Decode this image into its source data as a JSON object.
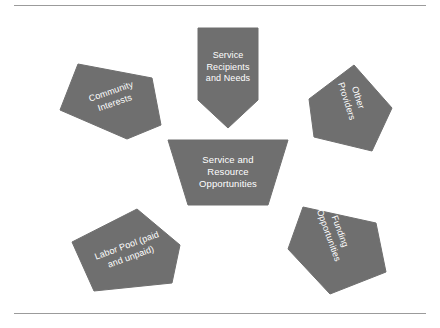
{
  "diagram": {
    "title": "Service and Resource Opportunities",
    "colors": {
      "shape_fill": "#6f6f6f",
      "shape_stroke": "#6f6f6f",
      "label_text": "#ffffff",
      "rule": "#9b9b9b",
      "background": "#ffffff"
    },
    "rules": {
      "top_label": "top-divider-rule",
      "bottom_label": "bottom-divider-rule"
    },
    "center": {
      "id": "service-and-resource-opportunities",
      "label": "Service and\nResource\nOpportunities",
      "shape": "trapezoid",
      "points": "168,140 288,140 268,205 188,205",
      "rotation": 0,
      "label_x": 178,
      "label_y": 154,
      "label_w": 100
    },
    "nodes": [
      {
        "id": "service-recipients-and-needs",
        "label": "Service\nRecipients\nand Needs",
        "shape": "pentagon-down",
        "points": "198,28 258,28 258,100 228,128 198,100",
        "rotation": 0,
        "label_x": 198,
        "label_y": 50,
        "label_w": 60
      },
      {
        "id": "community-interests",
        "label": "Community\nInterests",
        "shape": "pentagon-rotated",
        "points": "78,64 152,78 161,125 127,139 60,110",
        "rotation": -19,
        "label_x": 77,
        "label_y": 86,
        "label_w": 72
      },
      {
        "id": "other-providers",
        "label": "Other\nProviders",
        "shape": "pentagon-rotated",
        "points": "354,65 392,108 372,151 314,137 309,99",
        "rotation": 72,
        "label_x": 317,
        "label_y": 88,
        "label_w": 70
      },
      {
        "id": "labor-pool-paid-and-unpaid",
        "label": "Labor Pool (paid\nand unpaid)",
        "shape": "pentagon-rotated",
        "points": "137,209 180,245 172,283 94,291 72,242",
        "rotation": -20,
        "label_x": 83,
        "label_y": 240,
        "label_w": 92
      },
      {
        "id": "funding-opportunities",
        "label": "Funding\nOpportunities",
        "shape": "pentagon-rotated",
        "points": "303,207 376,223 386,272 330,294 288,249",
        "rotation": 70,
        "label_x": 290,
        "label_y": 222,
        "label_w": 88
      }
    ]
  }
}
